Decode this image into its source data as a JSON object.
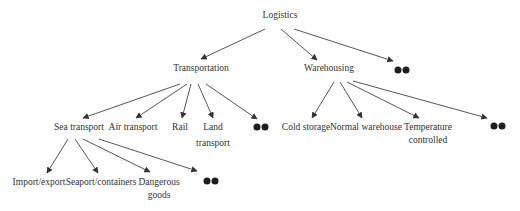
{
  "diagram": {
    "type": "tree",
    "colors": {
      "text": "#333333",
      "edge": "#444444",
      "more_dot": "#1e1e1e",
      "background": "#ffffff"
    },
    "root": {
      "label": "Logistics"
    },
    "level1": [
      {
        "id": "transportation",
        "label": "Transportation"
      },
      {
        "id": "warehousing",
        "label": "Warehousing"
      },
      {
        "id": "more",
        "label": "",
        "icon": "ellipsis-dots"
      }
    ],
    "transportation_children": [
      {
        "id": "sea",
        "label": "Sea transport"
      },
      {
        "id": "air",
        "label": "Air transport"
      },
      {
        "id": "rail",
        "label": "Rail"
      },
      {
        "id": "land",
        "label_line1": "Land",
        "label_line2": "transport"
      },
      {
        "id": "more",
        "icon": "ellipsis-dots"
      }
    ],
    "warehousing_children": [
      {
        "id": "cold",
        "label": "Cold storage"
      },
      {
        "id": "normal",
        "label": "Normal warehouse"
      },
      {
        "id": "temp",
        "label_line1": "Temperature",
        "label_line2": "controlled"
      },
      {
        "id": "more",
        "icon": "ellipsis-dots"
      }
    ],
    "sea_children": [
      {
        "id": "import",
        "label": "Import/export"
      },
      {
        "id": "seaport",
        "label": "Seaport/containers"
      },
      {
        "id": "dangerous",
        "label_line1": "Dangerous",
        "label_line2": "goods"
      },
      {
        "id": "more",
        "icon": "ellipsis-dots"
      }
    ]
  }
}
